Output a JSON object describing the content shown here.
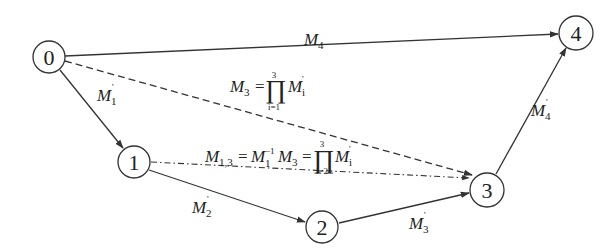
{
  "diagram": {
    "type": "directed-graph",
    "nodes": [
      {
        "id": "0",
        "label": "0",
        "cx": 49,
        "cy": 57
      },
      {
        "id": "1",
        "label": "1",
        "cx": 134,
        "cy": 162
      },
      {
        "id": "2",
        "label": "2",
        "cx": 322,
        "cy": 227
      },
      {
        "id": "3",
        "label": "3",
        "cx": 487,
        "cy": 190
      },
      {
        "id": "4",
        "label": "4",
        "cx": 576,
        "cy": 33
      }
    ],
    "edges": [
      {
        "from": "0",
        "to": "4",
        "style": "solid",
        "label": "M_4"
      },
      {
        "from": "0",
        "to": "1",
        "style": "solid",
        "label": "M'_1"
      },
      {
        "from": "0",
        "to": "3",
        "style": "dashed",
        "label": "M_3 = ∏_{i=1}^{3} M'_i"
      },
      {
        "from": "1",
        "to": "3",
        "style": "dash-dot",
        "label": "M_{1,3} = M_1^{-1} M_3 = ∏_{i=2}^{3} M'_i"
      },
      {
        "from": "1",
        "to": "2",
        "style": "solid",
        "label": "M'_2"
      },
      {
        "from": "2",
        "to": "3",
        "style": "solid",
        "label": "M'_3"
      },
      {
        "from": "3",
        "to": "4",
        "style": "solid",
        "label": "M'_4"
      }
    ],
    "labels": {
      "M": "M",
      "prime": "'",
      "eq": "=",
      "prod": "∏",
      "inv": "−1",
      "sub_1": "1",
      "sub_2": "2",
      "sub_3": "3",
      "sub_4": "4",
      "sub_13": "1,3",
      "sub_i": "i",
      "lim_i1": "i=1",
      "lim_i2": "i=2",
      "lim_top3": "3"
    }
  }
}
